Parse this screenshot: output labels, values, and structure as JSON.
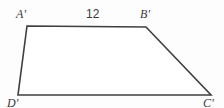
{
  "figure": {
    "kind": "trapezoid-diagram",
    "shape_name": "trapezoid A'B'C'D'",
    "stroke_color": "#3f3f3f",
    "fill_color": "#ffffff",
    "background_color": "#fdfdfd",
    "text_color": "#3a3a3a",
    "stroke_width": 1.6,
    "canvas": {
      "width": 224,
      "height": 108
    },
    "vertices": [
      {
        "name": "A'",
        "label": "A'",
        "x": 27,
        "y": 26
      },
      {
        "name": "B'",
        "label": "B'",
        "x": 146,
        "y": 27
      },
      {
        "name": "C'",
        "label": "C'",
        "x": 211,
        "y": 95
      },
      {
        "name": "D'",
        "label": "D'",
        "x": 18,
        "y": 95
      }
    ],
    "polygon_points": "27,26 146,27 211,95 18,95",
    "side_labels": [
      {
        "name": "A'B'",
        "value": "12",
        "between": [
          "A'",
          "B'"
        ]
      }
    ]
  }
}
